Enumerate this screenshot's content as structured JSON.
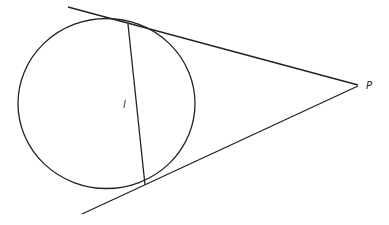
{
  "diagram": {
    "labels": {
      "point": "P",
      "chord": "l"
    },
    "colors": {
      "stroke": "#222222",
      "background": "#ffffff"
    }
  }
}
